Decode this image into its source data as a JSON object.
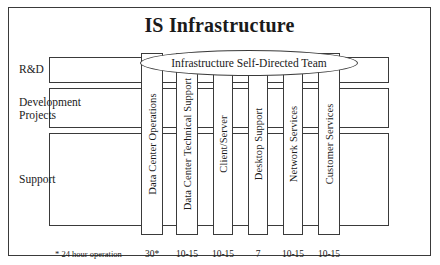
{
  "diagram": {
    "title": "IS Infrastructure",
    "team_ellipse": "Infrastructure Self-Directed Team",
    "footnote": "* 24 hour operation",
    "rows": [
      {
        "label": "R&D"
      },
      {
        "label": "Development\nProjects"
      },
      {
        "label": "Support"
      }
    ],
    "columns": [
      {
        "label": "Data Center Operations",
        "count": "30*"
      },
      {
        "label": "Data Center Technical Support",
        "count": "10-15"
      },
      {
        "label": "Client/Server",
        "count": "10-15"
      },
      {
        "label": "Desktop Support",
        "count": "7"
      },
      {
        "label": "Network Services",
        "count": "10-15"
      },
      {
        "label": "Customer Services",
        "count": "10-15"
      }
    ],
    "colors": {
      "line": "#3a3a3a",
      "background": "#ffffff",
      "text": "#1a1a1a"
    }
  }
}
